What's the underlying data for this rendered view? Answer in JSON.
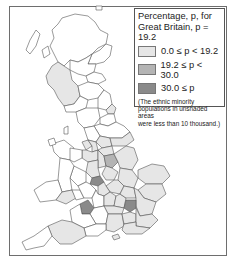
{
  "legend": {
    "title_line1": "Percentage, p, for",
    "title_line2": "Great Britain, p = 19.2",
    "items": [
      {
        "label": "0.0 ≤ p < 19.2",
        "color": "#e6e6e6"
      },
      {
        "label": "19.2 ≤ p < 30.0",
        "color": "#b4b4b4"
      },
      {
        "label": "30.0 ≤ p",
        "color": "#8a8a8a"
      }
    ],
    "note_line1": "(The ethnic minority",
    "note_line2": "populations in unshaded areas",
    "note_line3": "were less than 10 thousand.)"
  },
  "map": {
    "region": "Great Britain",
    "colors": {
      "unshaded": "#ffffff",
      "low": "#e6e6e6",
      "mid": "#b4b4b4",
      "high": "#8a8a8a",
      "border": "#555555"
    }
  }
}
